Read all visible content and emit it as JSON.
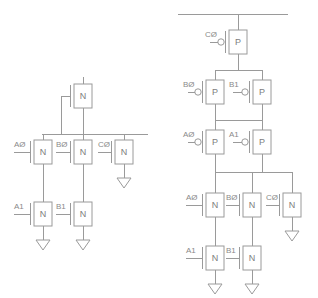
{
  "diagram": {
    "stroke_color": "#9a9a9a",
    "text_color": "#8a8a8a",
    "background_color": "#ffffff",
    "circuits": [
      {
        "id": "left-circuit",
        "name": "nmos-pulldown-network",
        "devices": [
          {
            "id": "L-top-N",
            "type": "N",
            "letter": "N",
            "label": "",
            "bubble": false,
            "x": 83,
            "y": 96
          },
          {
            "id": "L-A0",
            "type": "N",
            "letter": "N",
            "label": "AØ",
            "bubble": false,
            "x": 43,
            "y": 152
          },
          {
            "id": "L-B0",
            "type": "N",
            "letter": "N",
            "label": "BØ",
            "bubble": false,
            "x": 83,
            "y": 152
          },
          {
            "id": "L-C0",
            "type": "N",
            "letter": "N",
            "label": "CØ",
            "bubble": false,
            "x": 124,
            "y": 152
          },
          {
            "id": "L-A1",
            "type": "N",
            "letter": "N",
            "label": "A1",
            "bubble": false,
            "x": 43,
            "y": 214
          },
          {
            "id": "L-B1",
            "type": "N",
            "letter": "N",
            "label": "B1",
            "bubble": false,
            "x": 83,
            "y": 214
          }
        ],
        "grounds": [
          {
            "id": "L-gnd-C0",
            "x": 124,
            "y": 178
          },
          {
            "id": "L-gnd-A1",
            "x": 43,
            "y": 240
          },
          {
            "id": "L-gnd-B1",
            "x": 83,
            "y": 240
          }
        ],
        "labels": [
          "AØ",
          "BØ",
          "CØ",
          "A1",
          "B1"
        ]
      },
      {
        "id": "right-circuit",
        "name": "cmos-pullup-pulldown-network",
        "devices": [
          {
            "id": "R-C0p",
            "type": "P",
            "letter": "P",
            "label": "CØ",
            "bubble": true,
            "x": 238,
            "y": 42
          },
          {
            "id": "R-B0p",
            "type": "P",
            "letter": "P",
            "label": "BØ",
            "bubble": true,
            "x": 215,
            "y": 92
          },
          {
            "id": "R-B1p",
            "type": "P",
            "letter": "P",
            "label": "B1",
            "bubble": true,
            "x": 262,
            "y": 92
          },
          {
            "id": "R-A0p",
            "type": "P",
            "letter": "P",
            "label": "AØ",
            "bubble": true,
            "x": 215,
            "y": 142
          },
          {
            "id": "R-A1p",
            "type": "P",
            "letter": "P",
            "label": "A1",
            "bubble": true,
            "x": 262,
            "y": 142
          },
          {
            "id": "R-A0n",
            "type": "N",
            "letter": "N",
            "label": "AØ",
            "bubble": false,
            "x": 215,
            "y": 205
          },
          {
            "id": "R-B0n",
            "type": "N",
            "letter": "N",
            "label": "BØ",
            "bubble": false,
            "x": 252,
            "y": 205
          },
          {
            "id": "R-C0n",
            "type": "N",
            "letter": "N",
            "label": "CØ",
            "bubble": false,
            "x": 292,
            "y": 205
          },
          {
            "id": "R-A1n",
            "type": "N",
            "letter": "N",
            "label": "A1",
            "bubble": false,
            "x": 215,
            "y": 258
          },
          {
            "id": "R-B1n",
            "type": "N",
            "letter": "N",
            "label": "B1",
            "bubble": false,
            "x": 252,
            "y": 258
          }
        ],
        "grounds": [
          {
            "id": "R-gnd-C0",
            "x": 292,
            "y": 231
          },
          {
            "id": "R-gnd-A1",
            "x": 215,
            "y": 284
          },
          {
            "id": "R-gnd-B1",
            "x": 252,
            "y": 284
          }
        ],
        "labels": [
          "CØ",
          "BØ",
          "B1",
          "AØ",
          "A1",
          "AØ",
          "BØ",
          "CØ",
          "A1",
          "B1"
        ]
      }
    ]
  }
}
